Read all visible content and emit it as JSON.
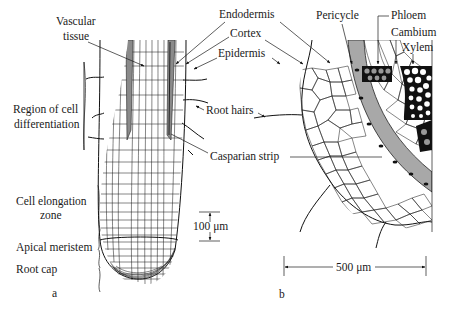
{
  "figure": {
    "panel_a": {
      "panel_label": "a",
      "labels": {
        "vascular_tissue_line1": "Vascular",
        "vascular_tissue_line2": "tissue",
        "region_diff_line1": "Region of cell",
        "region_diff_line2": "differentiation",
        "elongation_line1": "Cell elongation",
        "elongation_line2": "zone",
        "apical_meristem": "Apical meristem",
        "root_cap": "Root cap"
      },
      "scale_bar": "100 μm"
    },
    "panel_b": {
      "panel_label": "b",
      "labels": {
        "endodermis": "Endodermis",
        "cortex": "Cortex",
        "epidermis": "Epidermis",
        "pericycle": "Pericycle",
        "phloem": "Phloem",
        "cambium": "Cambium",
        "xylem": "Xylem",
        "root_hairs": "Root hairs",
        "casparian_strip": "Casparian strip"
      },
      "scale_bar": "500 μm"
    },
    "colors": {
      "ink": "#1a1a1a",
      "endodermis_fill": "#a8a8a8",
      "vascular_fill": "#8a8a8a",
      "background": "#ffffff"
    }
  }
}
